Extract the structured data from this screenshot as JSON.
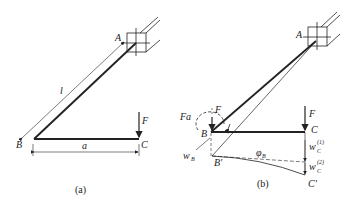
{
  "figure_a": {
    "caption": "(a)",
    "labels": {
      "A": "A",
      "B": "B",
      "C": "C",
      "F": "F",
      "l": "l",
      "a": "a"
    }
  },
  "figure_b": {
    "caption": "(b)",
    "labels": {
      "A": "A",
      "B": "B",
      "B_prime": "B'",
      "C": "C",
      "C_prime": "C'",
      "F_at_B": "F",
      "F_at_C": "F",
      "Fa": "Fa",
      "w_B": "w",
      "w_B_sub": "B",
      "phi_B": "φ",
      "phi_B_sub": "B",
      "w_C1": "w",
      "w_C1_sub": "C",
      "w_C1_sup": "(1)",
      "w_C2": "w",
      "w_C2_sub": "C",
      "w_C2_sup": "(2)"
    }
  },
  "colors": {
    "line": "#222222",
    "background": "#ffffff"
  }
}
